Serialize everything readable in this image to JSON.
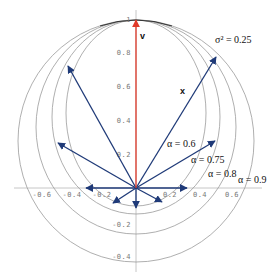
{
  "diagram": {
    "colors": {
      "background": "#ffffff",
      "axis": "#b8b8b8",
      "ellipse": "#9a9a9a",
      "vectors": "#1f3a78",
      "v_vector": "#e03a2a"
    },
    "axes": {
      "x_ticks": [
        {
          "label": "-0.6",
          "x": 42
        },
        {
          "label": "-0.4",
          "x": 72
        },
        {
          "label": "-0.2",
          "x": 102
        },
        {
          "label": "0.2",
          "x": 170
        },
        {
          "label": "0.4",
          "x": 200
        },
        {
          "label": "0.6",
          "x": 232
        }
      ],
      "y_ticks": [
        {
          "label": "1",
          "y": 22
        },
        {
          "label": "0.8",
          "y": 55
        },
        {
          "label": "0.6",
          "y": 89
        },
        {
          "label": "0.4",
          "y": 123
        },
        {
          "label": "0.2",
          "y": 157
        },
        {
          "label": "-0.2",
          "y": 227
        },
        {
          "label": "-0.4",
          "y": 259
        }
      ]
    },
    "labels": {
      "sigma": "σ² = 0.25",
      "v": "v",
      "x": "x",
      "alpha_06": "α = 0.6",
      "alpha_075": "α = 0.75",
      "alpha_08": "α = 0.8",
      "alpha_09": "α = 0.9"
    },
    "ellipses": [
      {
        "alpha": 0.6,
        "cx": 136,
        "cy": 113,
        "rx": 70,
        "ry": 93
      },
      {
        "alpha": 0.75,
        "cx": 136,
        "cy": 117,
        "rx": 84,
        "ry": 97
      },
      {
        "alpha": 0.8,
        "cx": 136,
        "cy": 127,
        "rx": 100,
        "ry": 107
      },
      {
        "alpha": 0.9,
        "cx": 136,
        "cy": 141,
        "rx": 118,
        "ry": 121
      }
    ],
    "origin": {
      "x": 136,
      "y": 188
    },
    "vectors": [
      {
        "name": "v",
        "x2": 136,
        "y2": 20,
        "color": "red"
      },
      {
        "name": "x",
        "x2": 216,
        "y2": 57
      },
      {
        "name": "upper-left",
        "x2": 68,
        "y2": 66
      },
      {
        "name": "left-mid",
        "x2": 58,
        "y2": 143
      },
      {
        "name": "left",
        "x2": 86,
        "y2": 188
      },
      {
        "name": "right-mid",
        "x2": 215,
        "y2": 141
      },
      {
        "name": "right",
        "x2": 187,
        "y2": 188
      },
      {
        "name": "down-left",
        "x2": 113,
        "y2": 203
      },
      {
        "name": "down",
        "x2": 136,
        "y2": 208
      },
      {
        "name": "down-right",
        "x2": 162,
        "y2": 202
      }
    ]
  }
}
